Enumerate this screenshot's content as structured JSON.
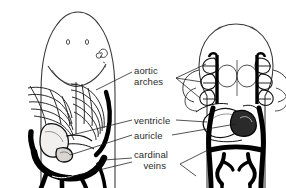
{
  "figure": {
    "width": 286,
    "height": 188,
    "background_color": "#ffffff",
    "ink_color": "#000000",
    "text_color": "#2b2b2b",
    "panels": [
      {
        "name": "left-panel",
        "description": "ventral view of elongated pointed head showing gill arches, heart and cardinal veins"
      },
      {
        "name": "right-panel",
        "description": "ventral view of rounded head showing paired aortic arch loops, heart and branching cardinal veins"
      }
    ]
  },
  "labels": {
    "aortic_arches": {
      "line1": "aortic",
      "line2": "arches",
      "full": "aortic arches"
    },
    "ventricle": {
      "full": "ventricle"
    },
    "auricle": {
      "full": "auricle"
    },
    "cardinal_veins": {
      "line1": "cardinal",
      "line2": "veins",
      "full": "cardinal veins"
    }
  },
  "colors": {
    "ink": "#000000",
    "outline": "#3a3a3a",
    "text": "#2b2b2b",
    "leader": "#1a1a1a",
    "background": "#ffffff",
    "fill_light": "#f2f0ee"
  }
}
